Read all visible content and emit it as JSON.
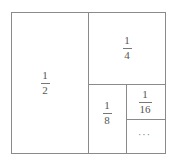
{
  "diagram": {
    "line_color": "#8a8a8a",
    "regions": [
      {
        "id": "half",
        "numerator": "1",
        "denominator": "2"
      },
      {
        "id": "quarter",
        "numerator": "1",
        "denominator": "4"
      },
      {
        "id": "eighth",
        "numerator": "1",
        "denominator": "8"
      },
      {
        "id": "sixteenth",
        "numerator": "1",
        "denominator": "16"
      },
      {
        "id": "rest",
        "label": "···"
      }
    ]
  }
}
